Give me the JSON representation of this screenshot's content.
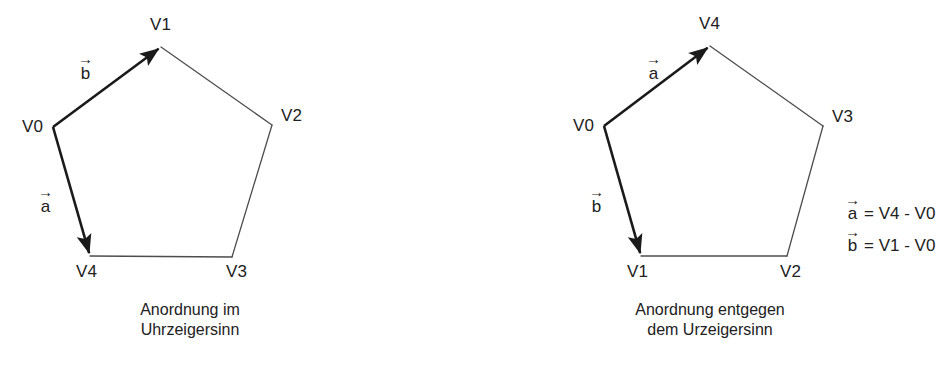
{
  "figure": {
    "background_color": "#ffffff",
    "ink_color": "#212121",
    "thin_edge_color": "#4d4d4d",
    "thick_edge_color": "#1a1a1a"
  },
  "panels": [
    {
      "id": "clockwise",
      "caption_lines": [
        "Anordnung im",
        "Uhrzeigersinn"
      ],
      "vertices": [
        {
          "name": "V0",
          "x": 53,
          "y": 127,
          "label_x": 22,
          "label_y": 118
        },
        {
          "name": "V1",
          "x": 161,
          "y": 47,
          "label_x": 150,
          "label_y": 16
        },
        {
          "name": "V2",
          "x": 272,
          "y": 125,
          "label_x": 281,
          "label_y": 107
        },
        {
          "name": "V3",
          "x": 232,
          "y": 257,
          "label_x": 226,
          "label_y": 263
        },
        {
          "name": "V4",
          "x": 90,
          "y": 256,
          "label_x": 76,
          "label_y": 263
        }
      ],
      "thin_edges": [
        {
          "from": "V1",
          "to": "V2"
        },
        {
          "from": "V2",
          "to": "V3"
        },
        {
          "from": "V3",
          "to": "V4"
        }
      ],
      "vector_edges": [
        {
          "label": "b",
          "arrow_glyph": "→",
          "from": "V0",
          "to": "V1",
          "label_x": 78,
          "label_y": 55
        },
        {
          "label": "a",
          "arrow_glyph": "→",
          "from": "V0",
          "to": "V4",
          "label_x": 38,
          "label_y": 188
        }
      ],
      "caption_center_x": 190,
      "caption_y": 300
    },
    {
      "id": "counter-clockwise",
      "caption_lines": [
        "Anordnung entgegen",
        "dem Urzeigersinn"
      ],
      "vertices": [
        {
          "name": "V0",
          "x": 604,
          "y": 126,
          "label_x": 573,
          "label_y": 117
        },
        {
          "name": "V4",
          "x": 710,
          "y": 46,
          "label_x": 699,
          "label_y": 15
        },
        {
          "name": "V3",
          "x": 823,
          "y": 126,
          "label_x": 832,
          "label_y": 108
        },
        {
          "name": "V2",
          "x": 787,
          "y": 256,
          "label_x": 780,
          "label_y": 263
        },
        {
          "name": "V1",
          "x": 641,
          "y": 256,
          "label_x": 627,
          "label_y": 263
        }
      ],
      "thin_edges": [
        {
          "from": "V4",
          "to": "V3"
        },
        {
          "from": "V3",
          "to": "V2"
        },
        {
          "from": "V2",
          "to": "V1"
        }
      ],
      "vector_edges": [
        {
          "label": "a",
          "arrow_glyph": "→",
          "from": "V0",
          "to": "V4",
          "label_x": 646,
          "label_y": 55
        },
        {
          "label": "b",
          "arrow_glyph": "→",
          "from": "V0",
          "to": "V1",
          "label_x": 589,
          "label_y": 188
        }
      ],
      "caption_center_x": 710,
      "caption_y": 300
    }
  ],
  "equations": {
    "x": 845,
    "y": 196,
    "rows": [
      {
        "vector": "a",
        "arrow_glyph": "→",
        "expression": "= V4 - V0"
      },
      {
        "vector": "b",
        "arrow_glyph": "→",
        "expression": "= V1 - V0"
      }
    ]
  }
}
